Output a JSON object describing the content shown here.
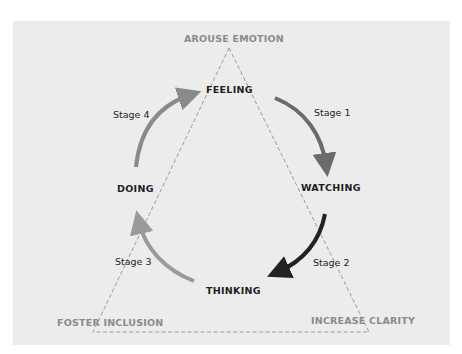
{
  "diagram": {
    "corners": {
      "top": "AROUSE EMOTION",
      "bottom_left": "FOSTER INCLUSION",
      "bottom_right": "INCREASE CLARITY"
    },
    "nodes": {
      "feeling": "FEELING",
      "watching": "WATCHING",
      "thinking": "THINKING",
      "doing": "DOING"
    },
    "stages": [
      {
        "label": "Stage 1",
        "from": "FEELING",
        "to": "WATCHING",
        "color": "#6b6b6b"
      },
      {
        "label": "Stage 2",
        "from": "WATCHING",
        "to": "THINKING",
        "color": "#222222"
      },
      {
        "label": "Stage 3",
        "from": "THINKING",
        "to": "DOING",
        "color": "#9a9a9a"
      },
      {
        "label": "Stage 4",
        "from": "DOING",
        "to": "FEELING",
        "color": "#8a8a8a"
      }
    ],
    "colors": {
      "panel_bg": "#ececec",
      "triangle_dash": "#9a9a9a",
      "corner_text": "#8a8a8a"
    }
  }
}
